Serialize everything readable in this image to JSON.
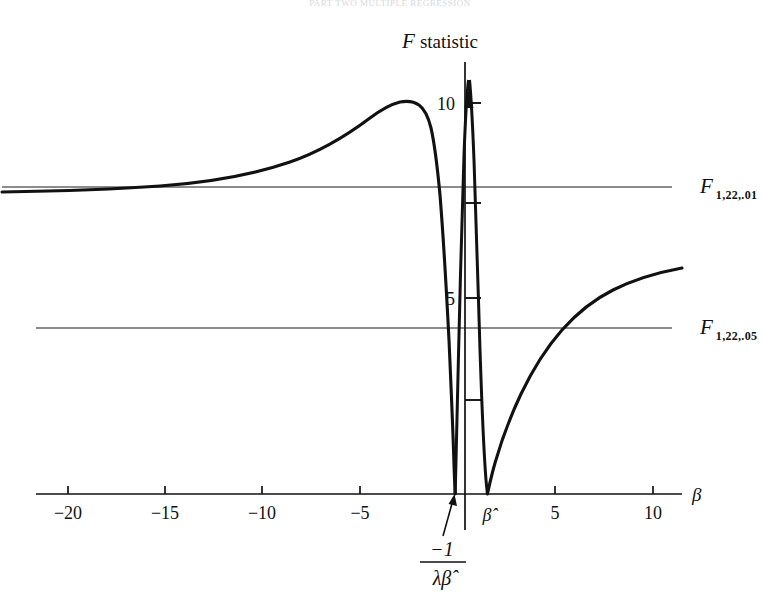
{
  "figure": {
    "cropped_header_text": "PART TWO  MULTIPLE REGRESSION",
    "axis_titles": {
      "y": "F statistic",
      "x": "β"
    },
    "reference_lines": [
      {
        "name": "F_1_22_01",
        "symbol": "F",
        "subscript": "1,22,.01",
        "value": 7.95,
        "label_x": 700,
        "label_y": 187
      },
      {
        "name": "F_1_22_05",
        "symbol": "F",
        "subscript": "1,22,.05",
        "value": 4.3,
        "label_x": 700,
        "label_y": 328
      }
    ],
    "annotation": {
      "numerator": "−1",
      "denominator": "λβ̂",
      "points_to": "left root of curve"
    },
    "x_special_labels": [
      {
        "label": "β̂",
        "x_value": 1.5
      }
    ]
  },
  "chart_data": {
    "type": "line",
    "xlabel": "β",
    "ylabel": "F statistic",
    "xlim": [
      -22.5,
      11.5
    ],
    "ylim": [
      0,
      11.2
    ],
    "grid": false,
    "legend": "none",
    "x_ticks": [
      -20,
      -15,
      -10,
      -5,
      5,
      10
    ],
    "x_tick_labels": [
      "−20",
      "−15",
      "−10",
      "−5",
      "5",
      "10"
    ],
    "y_ticks": [
      2.5,
      5,
      7.5,
      10
    ],
    "y_tick_labels": [
      "",
      "5",
      "",
      "10"
    ],
    "hlines": [
      {
        "label": "F 1,22,.01",
        "y": 7.95
      },
      {
        "label": "F 1,22,.05",
        "y": 4.3
      }
    ],
    "roots": [
      {
        "label": "-1/(lambda*beta-hat)",
        "x": -0.28
      },
      {
        "label": "beta-hat",
        "x": 1.48
      }
    ],
    "branches": [
      {
        "name": "left-branch",
        "points": [
          [
            -22.5,
            7.72
          ],
          [
            -21.0,
            7.76
          ],
          [
            -19.5,
            7.83
          ],
          [
            -18.0,
            7.92
          ],
          [
            -17.0,
            8.0
          ],
          [
            -16.0,
            8.12
          ],
          [
            -15.0,
            8.26
          ],
          [
            -14.0,
            8.44
          ],
          [
            -13.0,
            8.64
          ],
          [
            -12.0,
            8.87
          ],
          [
            -11.0,
            9.12
          ],
          [
            -10.0,
            9.38
          ],
          [
            -9.0,
            9.62
          ],
          [
            -8.0,
            9.85
          ],
          [
            -7.0,
            10.03
          ],
          [
            -6.0,
            10.16
          ],
          [
            -5.0,
            10.24
          ],
          [
            -4.2,
            10.27
          ],
          [
            -3.5,
            10.25
          ],
          [
            -3.0,
            10.18
          ],
          [
            -2.6,
            10.05
          ],
          [
            -2.3,
            9.85
          ],
          [
            -2.1,
            9.6
          ],
          [
            -1.95,
            9.3
          ],
          [
            -1.8,
            8.85
          ],
          [
            -1.65,
            8.2
          ],
          [
            -1.5,
            7.3
          ],
          [
            -1.35,
            6.3
          ],
          [
            -1.2,
            5.2
          ],
          [
            -1.05,
            4.1
          ],
          [
            -0.9,
            3.05
          ],
          [
            -0.75,
            2.1
          ],
          [
            -0.6,
            1.25
          ],
          [
            -0.48,
            0.68
          ],
          [
            -0.38,
            0.3
          ],
          [
            -0.31,
            0.08
          ],
          [
            -0.28,
            0.0
          ]
        ]
      },
      {
        "name": "spike-branch",
        "points": [
          [
            -0.28,
            0.0
          ],
          [
            -0.24,
            0.55
          ],
          [
            -0.2,
            1.6
          ],
          [
            -0.16,
            2.85
          ],
          [
            -0.12,
            4.2
          ],
          [
            -0.08,
            5.6
          ],
          [
            -0.04,
            7.0
          ],
          [
            0.0,
            8.35
          ],
          [
            0.04,
            9.5
          ],
          [
            0.08,
            10.35
          ],
          [
            0.12,
            10.9
          ],
          [
            0.16,
            11.1
          ],
          [
            0.22,
            10.85
          ],
          [
            0.28,
            10.1
          ],
          [
            0.36,
            9.0
          ],
          [
            0.46,
            7.6
          ],
          [
            0.58,
            6.1
          ],
          [
            0.72,
            4.6
          ],
          [
            0.88,
            3.25
          ],
          [
            1.04,
            2.1
          ],
          [
            1.18,
            1.2
          ],
          [
            1.32,
            0.52
          ],
          [
            1.42,
            0.14
          ],
          [
            1.48,
            0.0
          ]
        ]
      },
      {
        "name": "right-branch",
        "points": [
          [
            1.48,
            0.0
          ],
          [
            1.6,
            0.22
          ],
          [
            1.8,
            0.62
          ],
          [
            2.1,
            1.2
          ],
          [
            2.5,
            1.85
          ],
          [
            3.0,
            2.52
          ],
          [
            3.5,
            3.05
          ],
          [
            4.0,
            3.5
          ],
          [
            4.5,
            3.85
          ],
          [
            5.0,
            4.15
          ],
          [
            5.5,
            4.4
          ],
          [
            6.0,
            4.62
          ],
          [
            6.5,
            4.82
          ],
          [
            7.0,
            4.98
          ],
          [
            7.5,
            5.12
          ],
          [
            8.0,
            5.25
          ],
          [
            8.5,
            5.36
          ],
          [
            9.0,
            5.46
          ],
          [
            9.5,
            5.55
          ],
          [
            10.0,
            5.63
          ],
          [
            10.5,
            5.7
          ],
          [
            11.0,
            5.77
          ],
          [
            11.3,
            5.81
          ]
        ]
      }
    ],
    "peak": {
      "x": -4.2,
      "y": 10.27
    },
    "spike_peak": {
      "x": 0.16,
      "y": 11.1,
      "clipped_with_arrow": true
    }
  }
}
